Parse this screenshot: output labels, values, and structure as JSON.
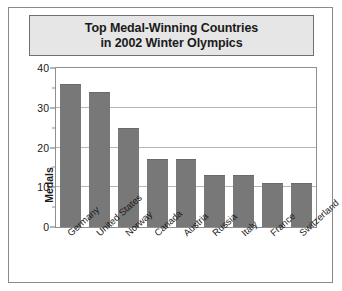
{
  "figure": {
    "title_lines": [
      "Top Medal-Winning Countries",
      "in 2002 Winter Olympics"
    ],
    "colors": {
      "bar_fill": "#787878",
      "title_background": "#e6e6e6",
      "frame_border": "#8a8a8a",
      "gridline": "#b6b6b6",
      "text": "#1a1a1a"
    }
  },
  "chart_data": {
    "type": "bar",
    "title": "Top Medal-Winning Countries in 2002 Winter Olympics",
    "xlabel": "",
    "ylabel": "Medals",
    "ylim": [
      0,
      40
    ],
    "yticks": [
      0,
      10,
      20,
      30,
      40
    ],
    "ytick_labels": [
      "0",
      "10",
      "20",
      "30",
      "40"
    ],
    "yminor_ticks": [
      5,
      15,
      25,
      35
    ],
    "grid": true,
    "legend": null,
    "categories": [
      "Germany",
      "United States",
      "Norway",
      "Canada",
      "Austria",
      "Russia",
      "Italy",
      "France",
      "Switzerland"
    ],
    "values": [
      36,
      34,
      25,
      17,
      17,
      13,
      13,
      11,
      11
    ]
  }
}
